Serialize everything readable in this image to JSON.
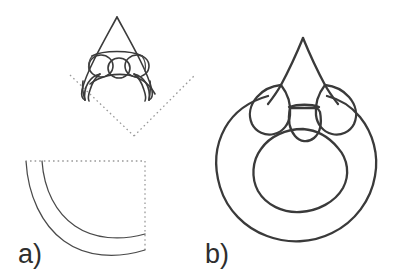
{
  "figure": {
    "kind": "scientific-line-drawing",
    "background_color": "#ffffff",
    "ink_color": "#3b3b3b",
    "guide_color": "#9a9a9a",
    "canvas": {
      "width": 404,
      "height": 277
    },
    "panels": [
      {
        "id": "a",
        "label": "a)",
        "label_x": 18,
        "label_y": 263,
        "description": "Detail view: pointed apex with three rounded lobes, shown above a dashed quarter-frame with two concentric arcs"
      },
      {
        "id": "b",
        "label": "b)",
        "label_x": 205,
        "label_y": 263,
        "description": "Full cross-section: thick ring with central opening, topped by a pointed spine flanked by three rounded lobes"
      }
    ],
    "elements": {
      "top_detail": {
        "name": "pointed-apex-detail",
        "apex_x": 117,
        "apex_y": 17,
        "lobe_count": 3
      },
      "guide_chevron": {
        "name": "dotted-chevron-guide",
        "left_x": 70,
        "left_y": 75,
        "vertex_x": 134,
        "vertex_y": 136,
        "right_x": 194,
        "right_y": 76
      },
      "guide_frame": {
        "name": "dotted-quarter-frame",
        "left_x": 30,
        "top_y": 161,
        "right_x": 145,
        "bottom_y": 250
      },
      "arcs": {
        "name": "concentric-arcs",
        "count": 2
      },
      "ring": {
        "name": "cross-section-ring",
        "center_x": 303,
        "center_y": 172,
        "outer_radius": 83,
        "inner_radius": 47
      },
      "spine": {
        "name": "apical-spine",
        "apex_x": 303,
        "apex_y": 38
      },
      "lobes": {
        "name": "rounded-lobes",
        "count": 3
      }
    }
  }
}
